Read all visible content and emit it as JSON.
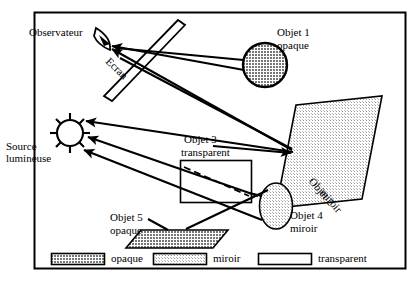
{
  "diagram": {
    "frame": {
      "stroke": "#000000",
      "fill": "#ffffff"
    }
  },
  "labels": {
    "observateur": "Observateur",
    "ecran": "Ecran",
    "source_line1": "Source",
    "source_line2": "lumineuse",
    "objet1_line1": "Objet 1",
    "objet1_line2": "opaque",
    "objet2_line1": "Objet 2",
    "objet2_line2": "miroir",
    "objet3_line1": "Objet 3",
    "objet3_line2": "transparent",
    "objet4_line1": "Objet 4",
    "objet4_line2": "miroir",
    "objet5_line1": "Objet 5",
    "objet5_line2": "opaque"
  },
  "legend": {
    "items": [
      {
        "label": "opaque",
        "swatch": "opaque-swatch",
        "fill": "#8a8a8a"
      },
      {
        "label": "miroir",
        "swatch": "miroir-swatch",
        "fill": "#d4d4d4"
      },
      {
        "label": "transparent",
        "swatch": "transparent-swatch",
        "fill": "#ffffff"
      }
    ]
  },
  "objects": [
    {
      "name": "objet-1",
      "shape": "circle",
      "material": "opaque",
      "fill": "#8a8a8a"
    },
    {
      "name": "objet-2",
      "shape": "parallelogram",
      "material": "miroir",
      "fill": "#d4d4d4"
    },
    {
      "name": "objet-3",
      "shape": "rectangle",
      "material": "transparent",
      "fill": "#ffffff"
    },
    {
      "name": "objet-4",
      "shape": "ellipse",
      "material": "miroir",
      "fill": "#d4d4d4"
    },
    {
      "name": "objet-5",
      "shape": "parallelogram",
      "material": "opaque",
      "fill": "#8a8a8a"
    },
    {
      "name": "ecran",
      "shape": "thin-parallelogram",
      "material": "ecran",
      "fill": "#ffffff"
    },
    {
      "name": "source-lumineuse",
      "shape": "sun",
      "material": "source",
      "fill": "#ffffff"
    },
    {
      "name": "observateur",
      "shape": "eye",
      "material": "observer",
      "fill": "#000000"
    }
  ],
  "rays": [
    {
      "name": "ray-source-to-objet1",
      "from": "source-lumineuse",
      "to": "objet-1"
    },
    {
      "name": "ray-objet1-to-eye",
      "from": "objet-1",
      "to": "observateur"
    },
    {
      "name": "ray-source-to-objet2",
      "from": "source-lumineuse",
      "to": "objet-2"
    },
    {
      "name": "ray-objet2-to-eye",
      "from": "objet-2",
      "to": "observateur"
    },
    {
      "name": "ray-source-to-objet4",
      "from": "source-lumineuse",
      "to": "objet-4"
    },
    {
      "name": "ray-objet4-to-objet3",
      "from": "objet-4",
      "to": "objet-3"
    },
    {
      "name": "ray-source-to-objet5",
      "from": "source-lumineuse",
      "to": "objet-5"
    },
    {
      "name": "ray-through-objet3",
      "from": "objet-3",
      "to": "objet-3",
      "style": "dashed"
    }
  ]
}
